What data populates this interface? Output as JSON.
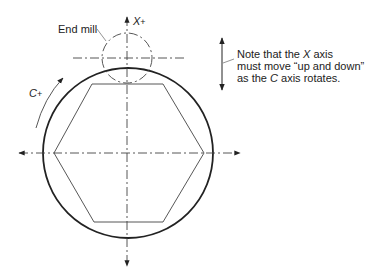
{
  "diagram": {
    "labels": {
      "end_mill": "End mill",
      "x_axis": "X",
      "x_sign": "+",
      "c_axis": "C",
      "c_sign": "+"
    },
    "note": {
      "line1_pre": "Note that the ",
      "line1_axis": "X",
      "line1_post": " axis",
      "line2": "must move “up and down”",
      "line3_pre": "as the ",
      "line3_axis": "C",
      "line3_post": " axis rotates."
    },
    "colors": {
      "stroke": "#222222",
      "background": "#ffffff"
    },
    "geometry": {
      "workpiece_circle": {
        "cx": 128,
        "cy": 153,
        "r": 85
      },
      "end_mill_circle": {
        "cx": 127,
        "cy": 58,
        "r": 25
      },
      "hexagon": "92,84 163,84 204,153 163,222 94,222 54,153"
    }
  }
}
